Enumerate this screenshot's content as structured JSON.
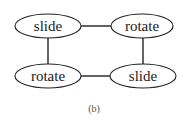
{
  "diagram": {
    "nodes": [
      {
        "id": "tl",
        "label": "slide",
        "cx": 48,
        "cy": 26,
        "rx": 33,
        "ry": 12
      },
      {
        "id": "tr",
        "label": "rotate",
        "cx": 142,
        "cy": 26,
        "rx": 31,
        "ry": 12
      },
      {
        "id": "bl",
        "label": "rotate",
        "cx": 48,
        "cy": 76,
        "rx": 33,
        "ry": 12
      },
      {
        "id": "br",
        "label": "slide",
        "cx": 143,
        "cy": 76,
        "rx": 33,
        "ry": 12
      }
    ],
    "edges": [
      {
        "from": "tl",
        "to": "tr"
      },
      {
        "from": "tl",
        "to": "bl"
      },
      {
        "from": "tr",
        "to": "br"
      },
      {
        "from": "bl",
        "to": "br"
      }
    ],
    "caption": "(b)"
  }
}
